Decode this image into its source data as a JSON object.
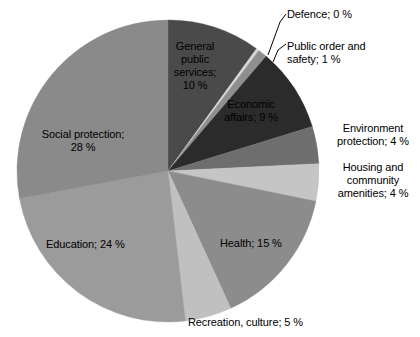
{
  "chart_data": {
    "type": "pie",
    "title": "",
    "subtitle": "",
    "xlabel": "",
    "ylabel": "",
    "units": "%",
    "label_format": "{name}; {value} %",
    "legend_position": "none",
    "grid": false,
    "start_angle_deg": 0,
    "direction": "clockwise",
    "center": {
      "x": 168,
      "y": 171
    },
    "radius": 151,
    "categories": [
      "General public services",
      "Defence",
      "Public order and safety",
      "Economic affairs",
      "Environment protection",
      "Housing and community amenities",
      "Health",
      "Recreation, culture",
      "Education",
      "Social protection"
    ],
    "values": [
      10,
      0,
      1,
      9,
      4,
      4,
      15,
      5,
      24,
      28
    ],
    "colors": [
      "#4a4a4a",
      "#d8d8d8",
      "#8f8f8f",
      "#2b2b2b",
      "#6e6e6e",
      "#c5c5c5",
      "#8c8c8c",
      "#c0c0c0",
      "#9b9b9b",
      "#8a8a8a"
    ],
    "slices": [
      {
        "name": "General public services",
        "value": 10,
        "label": "General\npublic\nservices;\n10 %",
        "color": "#4a4a4a",
        "label_placement": "inside"
      },
      {
        "name": "Defence",
        "value": 0,
        "label": "Defence; 0 %",
        "color": "#d8d8d8",
        "label_placement": "outside-leader"
      },
      {
        "name": "Public order and safety",
        "value": 1,
        "label": "Public order and\nsafety; 1 %",
        "color": "#8f8f8f",
        "label_placement": "outside-leader"
      },
      {
        "name": "Economic affairs",
        "value": 9,
        "label": "Economic\naffairs; 9 %",
        "color": "#2b2b2b",
        "label_placement": "inside"
      },
      {
        "name": "Environment protection",
        "value": 4,
        "label": "Environment\nprotection; 4 %",
        "color": "#6e6e6e",
        "label_placement": "outside"
      },
      {
        "name": "Housing and community amenities",
        "value": 4,
        "label": "Housing and\ncommunity\namenities; 4 %",
        "color": "#c5c5c5",
        "label_placement": "outside"
      },
      {
        "name": "Health",
        "value": 15,
        "label": "Health; 15 %",
        "color": "#8c8c8c",
        "label_placement": "inside"
      },
      {
        "name": "Recreation, culture",
        "value": 5,
        "label": "Recreation, culture; 5 %",
        "color": "#c0c0c0",
        "label_placement": "outside"
      },
      {
        "name": "Education",
        "value": 24,
        "label": "Education; 24 %",
        "color": "#9b9b9b",
        "label_placement": "inside"
      },
      {
        "name": "Social protection",
        "value": 28,
        "label": "Social protection;\n28 %",
        "color": "#8a8a8a",
        "label_placement": "inside"
      }
    ],
    "leader_lines": [
      {
        "for": "Defence",
        "from": {
          "x": 268,
          "y": 55
        },
        "to": {
          "x": 280,
          "y": 22
        },
        "elbow": {
          "x": 286,
          "y": 14
        }
      },
      {
        "for": "Public order and safety",
        "from": {
          "x": 273,
          "y": 62
        },
        "to": {
          "x": 278,
          "y": 50
        },
        "elbow": {
          "x": 286,
          "y": 44
        }
      }
    ]
  }
}
